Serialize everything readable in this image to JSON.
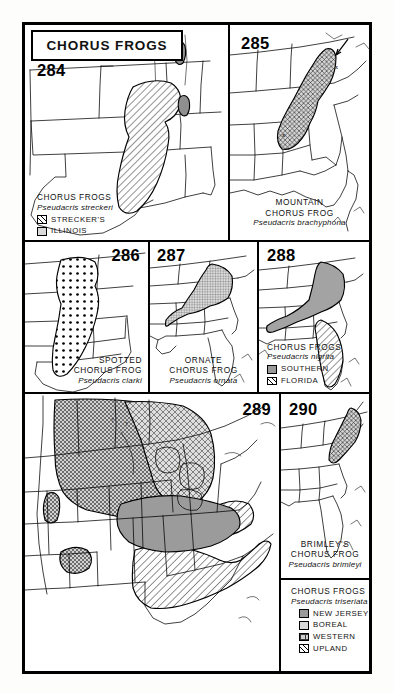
{
  "plate": {
    "title": "CHORUS FROGS",
    "panels": [
      {
        "number": "284",
        "common_name": "CHORUS FROGS",
        "scientific_name": "Pseudacris streckeri",
        "legend": [
          {
            "label": "STRECKER'S",
            "pattern": "diagonal-hatch"
          },
          {
            "label": "ILLINOIS",
            "pattern": "fine-grid"
          }
        ]
      },
      {
        "number": "285",
        "common_name_line1": "MOUNTAIN",
        "common_name_line2": "CHORUS FROG",
        "scientific_name": "Pseudacris brachyphona",
        "legend": []
      },
      {
        "number": "286",
        "common_name_line1": "SPOTTED",
        "common_name_line2": "CHORUS FROG",
        "scientific_name": "Pseudacris clarki",
        "legend": []
      },
      {
        "number": "287",
        "common_name_line1": "ORNATE",
        "common_name_line2": "CHORUS FROG",
        "scientific_name": "Pseudacris ornata",
        "legend": []
      },
      {
        "number": "288",
        "common_name": "CHORUS FROGS",
        "scientific_name": "Pseudacris nigrita",
        "legend": [
          {
            "label": "SOUTHERN",
            "pattern": "solid-gray"
          },
          {
            "label": "FLORIDA",
            "pattern": "diagonal-hatch"
          }
        ]
      },
      {
        "number": "289",
        "common_name": "CHORUS FROGS",
        "scientific_name": "Pseudacris triseriata",
        "legend": [
          {
            "label": "NEW JERSEY",
            "pattern": "solid-gray"
          },
          {
            "label": "BOREAL",
            "pattern": "cross-hatch"
          },
          {
            "label": "WESTERN",
            "pattern": "dense-cross-hatch"
          },
          {
            "label": "UPLAND",
            "pattern": "diagonal-hatch"
          }
        ]
      },
      {
        "number": "290",
        "common_name_line1": "BRIMLEY'S",
        "common_name_line2": "CHORUS FROG",
        "scientific_name": "Pseudacris brimleyi",
        "legend": []
      }
    ],
    "map_markers": {
      "uncertain": "?"
    },
    "colors": {
      "ink": "#000000",
      "paper": "#ffffff",
      "tone_light": "#d9d9d9",
      "tone_mid": "#cfcfcf",
      "tone_dark": "#9a9a9a"
    }
  }
}
